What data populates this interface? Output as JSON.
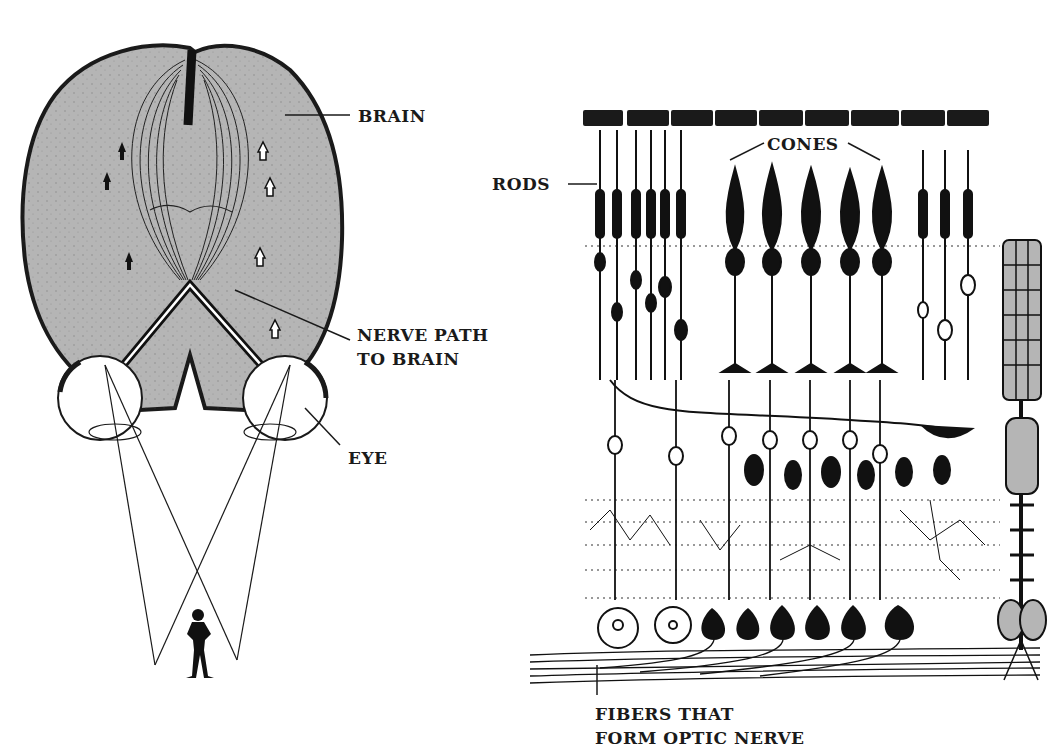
{
  "figure": {
    "left_panel": {
      "title": "Visual pathway from eyes to brain",
      "labels": {
        "brain": "BRAIN",
        "nerve_path_line1": "NERVE PATH",
        "nerve_path_line2": "TO BRAIN",
        "eye": "EYE"
      }
    },
    "right_panel": {
      "title": "Retinal cell layers",
      "labels": {
        "rods": "RODS",
        "cones": "CONES",
        "fibers_line1": "FIBERS THAT",
        "fibers_line2": "FORM OPTIC NERVE"
      }
    },
    "colors": {
      "ink": "#1a1a1a",
      "brain_fill": "#b5b5b5",
      "background": "#ffffff"
    }
  }
}
